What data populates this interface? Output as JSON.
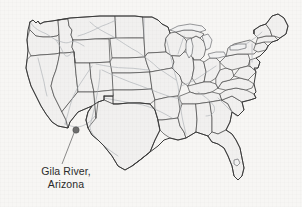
{
  "figure": {
    "background_color": "#f7f6f4",
    "state_fill_color": "#f1f0ef",
    "state_border_color": "#4a4a4a",
    "river_color": "#a9adb2",
    "marker_color": "#6e6e6e",
    "text_color": "#2b2b2b"
  },
  "callout": {
    "line1": "Gila River,",
    "line2": "Arizona",
    "marker_point": {
      "x": 76,
      "y": 130
    },
    "leader_from": {
      "x": 74,
      "y": 133
    },
    "leader_to": {
      "x": 62,
      "y": 164
    }
  },
  "map": {
    "region": "United States (lower 48)",
    "projection_hint": "conic",
    "features": {
      "states_outlined": true,
      "rivers_shown": true,
      "great_lakes_shown": true,
      "lake_okeechobee_shown": true,
      "grid": false,
      "legend": false
    }
  }
}
